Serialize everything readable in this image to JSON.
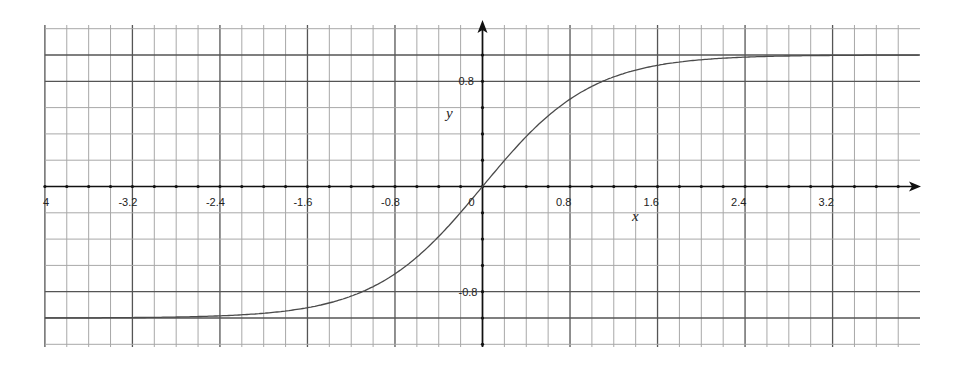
{
  "chart_data": {
    "type": "line",
    "title": "",
    "xlabel": "x",
    "ylabel": "y",
    "function": "tanh(x)",
    "xlim": [
      -4,
      4
    ],
    "ylim": [
      -1.2,
      1.2
    ],
    "grid": true,
    "grid_minor_step": {
      "x": 0.2,
      "y": 0.2
    },
    "x_tick_labels": [
      "4",
      "-3.2",
      "-2.4",
      "-1.6",
      "-0.8",
      "0",
      "0.8",
      "1.6",
      "2.4",
      "3.2"
    ],
    "x_tick_values": [
      -4,
      -3.2,
      -2.4,
      -1.6,
      -0.8,
      0,
      0.8,
      1.6,
      2.4,
      3.2
    ],
    "y_tick_labels": [
      "0.8",
      "-0.8"
    ],
    "y_tick_values": [
      0.8,
      -0.8
    ],
    "series": [
      {
        "name": "y = tanh(x)",
        "x": [
          -4,
          -3.2,
          -2.4,
          -1.6,
          -1.2,
          -0.8,
          -0.4,
          0,
          0.4,
          0.8,
          1.2,
          1.6,
          2.4,
          3.2,
          4
        ],
        "y": [
          -1.0,
          -1.0,
          -0.98,
          -0.92,
          -0.83,
          -0.66,
          -0.38,
          0,
          0.38,
          0.66,
          0.83,
          0.92,
          0.98,
          1.0,
          1.0
        ]
      }
    ],
    "legend": null
  },
  "colors": {
    "curve": "#4a4a4a",
    "axis": "#111111",
    "grid_minor": "#a8a8a8",
    "grid_major": "#555555"
  }
}
